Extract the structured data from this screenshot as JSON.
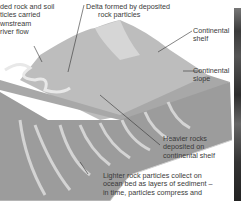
{
  "diagram": {
    "type": "cross-section illustration",
    "labels": {
      "eroded": [
        "ded rock and soil",
        "ticles carried",
        "wnstream",
        "river flow"
      ],
      "delta": [
        "Delta formed by deposited",
        "rock particles"
      ],
      "shelf": [
        "Continental",
        "shelf"
      ],
      "slope": [
        "Continental",
        "slope"
      ],
      "heavier": [
        "Heavier rocks",
        "deposited on",
        "continental shelf"
      ],
      "lighter": [
        "Lighter rock particles collect on",
        "ocean bed as layers of sediment –",
        "in time, particles compress and"
      ]
    },
    "colors": {
      "land": "#b9b9b9",
      "shelf_plane": "#a9a9a9",
      "slope": "#9a9a9a",
      "ridges": "#e4e4e4",
      "leader": "#333333",
      "photo_strip": "#3a3a3a"
    }
  }
}
